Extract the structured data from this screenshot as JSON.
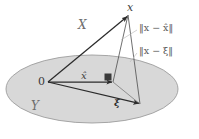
{
  "figure": {
    "labels": {
      "apex_point": "x",
      "ambient_space": "X",
      "subspace": "Y",
      "origin": "0",
      "projection": "x̂",
      "arbitrary_point": "ξ",
      "norm_to_projection": "‖x − x̂‖",
      "norm_to_point": "‖x − ξ‖"
    },
    "colors": {
      "plane_fill": "#d6d6d6",
      "plane_stroke": "#9a9a9a",
      "solid_line": "#2b2b2b",
      "thin_line": "#8c8c8c",
      "leader_line": "#b0b0b0",
      "label_text": "#4a4a4a",
      "background": "#ffffff"
    },
    "geometry": {
      "plane_ellipse": {
        "cx": 92,
        "cy": 89,
        "rx": 86,
        "ry": 34
      },
      "points": {
        "x": [
          128,
          15
        ],
        "origin": [
          48,
          82
        ],
        "x_hat": [
          113,
          82
        ],
        "xi": [
          140,
          104
        ]
      },
      "right_angle_marker": {
        "x": 104,
        "y": 74,
        "size": 7
      }
    }
  }
}
